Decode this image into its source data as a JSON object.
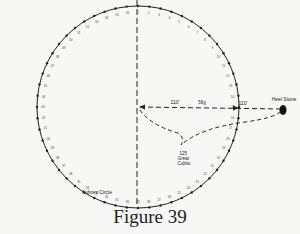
{
  "figure": {
    "caption": "Figure 39",
    "circle_label": "Aubrey Circle",
    "heel_stone_label": "Heel Stone",
    "distance_left_label": "110'",
    "distance_right_label": "110'",
    "center_mark_label": "56g",
    "cubits_label_line1": "125",
    "cubits_label_line2": "Great",
    "cubits_label_line3": "Cubits",
    "hole_count": 56,
    "colors": {
      "ink": "#222222",
      "background": "#f7f7f5"
    }
  }
}
